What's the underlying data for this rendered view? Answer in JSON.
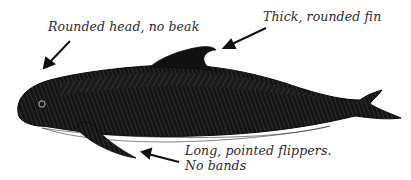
{
  "figure": {
    "annotations": {
      "head": "Rounded head, no beak",
      "fin": "Thick, rounded fin",
      "flippers_line1": "Long, pointed flippers.",
      "flippers_line2": "No bands"
    },
    "colors": {
      "ink": "#111111",
      "text": "#2a2a2a",
      "background": "#ffffff"
    }
  }
}
